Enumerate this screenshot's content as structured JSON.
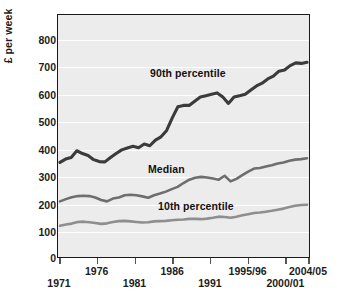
{
  "chart_data": {
    "type": "line",
    "title": "",
    "xlabel": "",
    "ylabel": "£ per week",
    "ylim": [
      0,
      870
    ],
    "yticks": [
      0,
      100,
      200,
      300,
      400,
      500,
      600,
      700,
      800
    ],
    "ytick_labels": [
      "0",
      "100",
      "200",
      "300",
      "400",
      "500",
      "600",
      "700",
      "800"
    ],
    "grid": "horizontal",
    "legend": "inline-annotations",
    "xlim": [
      1971,
      2004
    ],
    "xticks": [
      1971,
      1976,
      1981,
      1986,
      1991,
      1996,
      2001,
      2004
    ],
    "xtick_labels": [
      "1971",
      "1976",
      "1981",
      "1986",
      "1991",
      "1995/96",
      "2000/01",
      "2004/05"
    ],
    "xtick_rows": [
      1,
      0,
      1,
      0,
      1,
      0,
      1,
      0
    ],
    "x": [
      1971,
      1972,
      1973,
      1974,
      1975,
      1976,
      1977,
      1978,
      1979,
      1980,
      1981,
      1982,
      1983,
      1984,
      1985,
      1986,
      1987,
      1988,
      1989,
      1990,
      1991,
      1992,
      1993,
      1994,
      1995,
      1996,
      1997,
      1998,
      1999,
      2000,
      2001,
      2002,
      2003,
      2004
    ],
    "series": [
      {
        "name": "90th percentile",
        "color": "#3b3b3b",
        "width": 3.1,
        "label_x": 1988,
        "label_y": 640,
        "values": [
          340,
          352,
          358,
          382,
          372,
          365,
          350,
          343,
          342,
          358,
          372,
          385,
          392,
          398,
          393,
          406,
          400,
          420,
          432,
          455,
          500,
          540,
          545,
          545,
          560,
          575,
          580,
          585,
          590,
          575,
          552,
          575,
          580,
          585
        ]
      },
      {
        "name": "Median",
        "color": "#6e6e6e",
        "width": 2.6,
        "label_x": 1988,
        "label_y": 330,
        "values": [
          200,
          208,
          215,
          219,
          220,
          219,
          214,
          205,
          200,
          210,
          214,
          222,
          224,
          222,
          218,
          213,
          222,
          228,
          235,
          244,
          252,
          266,
          278,
          285,
          288,
          286,
          282,
          278,
          292,
          272,
          281,
          294,
          307,
          318
        ]
      },
      {
        "name": "10th percentile",
        "color": "#8e8e8e",
        "width": 2.6,
        "label_x": 1990,
        "label_y": 214,
        "values": [
          112,
          117,
          120,
          126,
          127,
          125,
          122,
          119,
          121,
          126,
          129,
          130,
          128,
          126,
          124,
          125,
          128,
          129,
          130,
          132,
          134,
          135,
          137,
          137,
          136,
          138,
          141,
          145,
          144,
          141,
          145,
          150,
          154,
          158
        ]
      }
    ],
    "series_tail_note": {
      "90th percentile": [
        600,
        615,
        625,
        640,
        650,
        668,
        672,
        688,
        698,
        696,
        700
      ],
      "Median": [
        320,
        325,
        330,
        336,
        340,
        346,
        350,
        352,
        355
      ],
      "10th percentile": [
        160,
        163,
        166,
        170,
        174,
        180,
        184,
        187,
        188
      ]
    }
  },
  "annotations": {
    "p90_label": "90th percentile",
    "median_label": "Median",
    "p10_label": "10th percentile"
  }
}
